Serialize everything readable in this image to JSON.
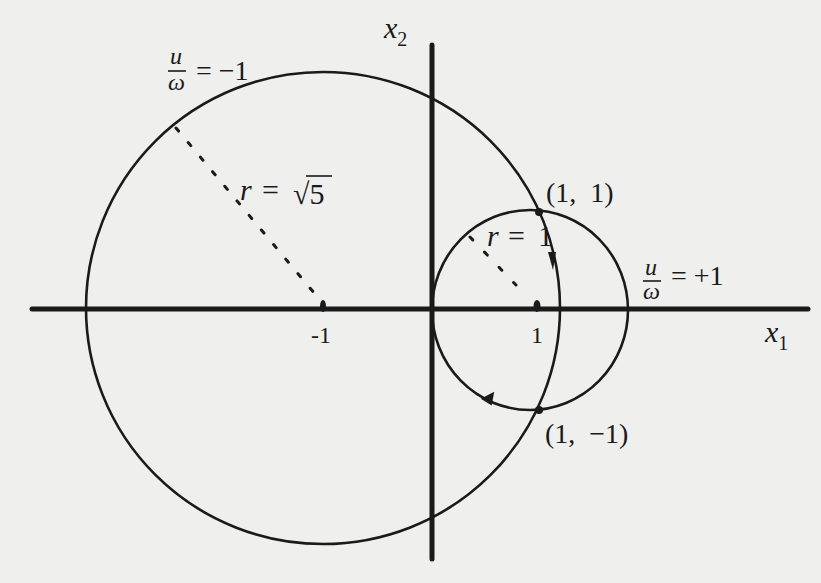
{
  "figure": {
    "background": "#efefed",
    "ink_color": "#1a1a1a",
    "axes": {
      "x_label": "x",
      "x_label_sub": "1",
      "y_label": "x",
      "y_label_sub": "2",
      "origin_px": [
        432,
        309
      ],
      "unit_px": 107
    },
    "ticks": [
      {
        "label": "-1",
        "value": -1
      },
      {
        "label": "1",
        "value": 1
      }
    ],
    "circles": [
      {
        "name": "large-circle",
        "center": [
          -1,
          0
        ],
        "radius_label_var": "r",
        "radius_label_eq": "=",
        "radius_label_value": "√5",
        "control_label_num": "u",
        "control_label_den": "ω",
        "control_label_eq": "= −1"
      },
      {
        "name": "small-circle",
        "center": [
          1,
          0
        ],
        "radius_label_var": "r",
        "radius_label_eq": "=",
        "radius_label_value": "1",
        "control_label_num": "u",
        "control_label_den": "ω",
        "control_label_eq": "= +1"
      }
    ],
    "points": [
      {
        "label": "(1,  1)",
        "coords": [
          1,
          1
        ]
      },
      {
        "label": "(1,  −1)",
        "coords": [
          1,
          -1
        ]
      }
    ]
  }
}
